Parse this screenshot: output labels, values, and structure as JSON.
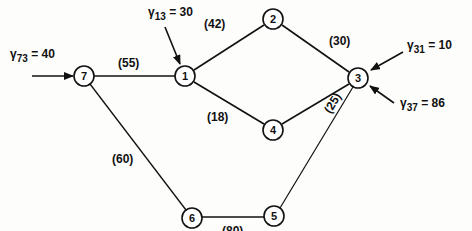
{
  "nodes": [
    {
      "id": "7",
      "x": 84,
      "y": 76
    },
    {
      "id": "1",
      "x": 185,
      "y": 76
    },
    {
      "id": "2",
      "x": 273,
      "y": 19
    },
    {
      "id": "3",
      "x": 358,
      "y": 78
    },
    {
      "id": "4",
      "x": 273,
      "y": 130
    },
    {
      "id": "6",
      "x": 192,
      "y": 218
    },
    {
      "id": "5",
      "x": 274,
      "y": 216
    }
  ],
  "edges": [
    {
      "from": "7",
      "to": "1",
      "label": "(55)"
    },
    {
      "from": "1",
      "to": "2",
      "label": "(42)"
    },
    {
      "from": "2",
      "to": "3",
      "label": "(30)"
    },
    {
      "from": "1",
      "to": "4",
      "label": "(18)"
    },
    {
      "from": "4",
      "to": "3",
      "label": "(25)"
    },
    {
      "from": "7",
      "to": "6",
      "label": "(60)"
    },
    {
      "from": "6",
      "to": "5",
      "label": "(80)"
    },
    {
      "from": "5",
      "to": "3",
      "label": ""
    }
  ],
  "inputs": [
    {
      "symbol": "γ",
      "sub": "73",
      "value": "= 40",
      "target": "7"
    },
    {
      "symbol": "γ",
      "sub": "13",
      "value": "= 30",
      "target": "1"
    },
    {
      "symbol": "γ",
      "sub": "31",
      "value": "= 10",
      "target": "3"
    },
    {
      "symbol": "γ",
      "sub": "37",
      "value": "= 86",
      "target": "3"
    }
  ]
}
